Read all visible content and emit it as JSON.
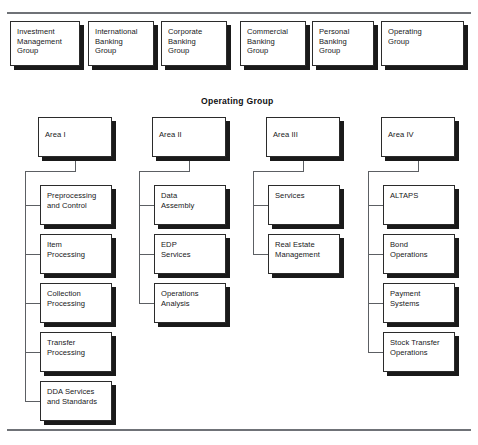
{
  "page": {
    "top_rule": true,
    "bottom_rule": true
  },
  "divisions": {
    "label": "top-level division boxes",
    "items": [
      {
        "name": "investment-management-group",
        "text": "Investment\nManagement\nGroup",
        "x": 10,
        "y": 21,
        "w": 70,
        "h": 45
      },
      {
        "name": "international-banking-group",
        "text": "International\nBanking\nGroup",
        "x": 88,
        "y": 21,
        "w": 66,
        "h": 45
      },
      {
        "name": "corporate-banking-group",
        "text": "Corporate\nBanking\nGroup",
        "x": 161,
        "y": 21,
        "w": 66,
        "h": 45
      },
      {
        "name": "commercial-banking-group",
        "text": "Commercial\nBanking\nGroup",
        "x": 240,
        "y": 21,
        "w": 66,
        "h": 45
      },
      {
        "name": "personal-banking-group",
        "text": "Personal\nBanking\nGroup",
        "x": 312,
        "y": 21,
        "w": 62,
        "h": 45
      },
      {
        "name": "operating-group",
        "text": "Operating\nGroup",
        "x": 381,
        "y": 21,
        "w": 83,
        "h": 45
      }
    ]
  },
  "section": {
    "heading": "Operating Group",
    "heading_x": 201,
    "heading_y": 96
  },
  "areas": [
    {
      "name": "area-i",
      "text": "Area I",
      "x": 38,
      "y": 117,
      "w": 74,
      "h": 40,
      "spine_x": 25,
      "children": [
        {
          "name": "preprocessing-and-control",
          "text": "Preprocessing\nand Control",
          "x": 40,
          "y": 185,
          "w": 72,
          "h": 40
        },
        {
          "name": "item-processing",
          "text": "Item\nProcessing",
          "x": 40,
          "y": 234,
          "w": 72,
          "h": 40
        },
        {
          "name": "collection-processing",
          "text": "Collection\nProcessing",
          "x": 40,
          "y": 283,
          "w": 72,
          "h": 40
        },
        {
          "name": "transfer-processing",
          "text": "Transfer\nProcessing",
          "x": 40,
          "y": 332,
          "w": 72,
          "h": 40
        },
        {
          "name": "dda-services-and-standards",
          "text": "DDA Services\nand Standards",
          "x": 40,
          "y": 381,
          "w": 72,
          "h": 40
        }
      ]
    },
    {
      "name": "area-ii",
      "text": "Area II",
      "x": 152,
      "y": 117,
      "w": 74,
      "h": 40,
      "spine_x": 139,
      "children": [
        {
          "name": "data-assembly",
          "text": "Data\nAssembly",
          "x": 154,
          "y": 185,
          "w": 72,
          "h": 40
        },
        {
          "name": "edp-services",
          "text": "EDP\nServices",
          "x": 154,
          "y": 234,
          "w": 72,
          "h": 40
        },
        {
          "name": "operations-analysis",
          "text": "Operations\nAnalysis",
          "x": 154,
          "y": 283,
          "w": 72,
          "h": 40
        }
      ]
    },
    {
      "name": "area-iii",
      "text": "Area III",
      "x": 266,
      "y": 117,
      "w": 74,
      "h": 40,
      "spine_x": 253,
      "children": [
        {
          "name": "services",
          "text": "Services",
          "x": 268,
          "y": 185,
          "w": 72,
          "h": 40
        },
        {
          "name": "real-estate-management",
          "text": "Real Estate\nManagement",
          "x": 268,
          "y": 234,
          "w": 72,
          "h": 40
        }
      ]
    },
    {
      "name": "area-iv",
      "text": "Area IV",
      "x": 381,
      "y": 117,
      "w": 74,
      "h": 40,
      "spine_x": 368,
      "children": [
        {
          "name": "altaps",
          "text": "ALTAPS",
          "x": 383,
          "y": 185,
          "w": 72,
          "h": 40
        },
        {
          "name": "bond-operations",
          "text": "Bond\nOperations",
          "x": 383,
          "y": 234,
          "w": 72,
          "h": 40
        },
        {
          "name": "payment-systems",
          "text": "Payment\nSystems",
          "x": 383,
          "y": 283,
          "w": 72,
          "h": 40
        },
        {
          "name": "stock-transfer-operations",
          "text": "Stock Transfer\nOperations",
          "x": 383,
          "y": 332,
          "w": 72,
          "h": 40
        }
      ]
    }
  ],
  "colors": {
    "rule": "#6f7277",
    "box_border": "#2b2b2b",
    "box_shadow": "#1a1a1a",
    "box_fill": "#ffffff",
    "text": "#18181a",
    "connector": "#5c5f63"
  }
}
